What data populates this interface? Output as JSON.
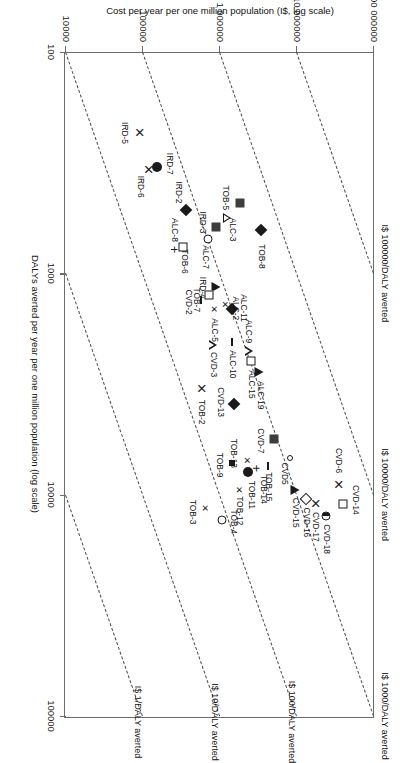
{
  "chart_data": {
    "type": "scatter",
    "title": "",
    "xlabel": "DALYs averted per year per one million population (log scale)",
    "ylabel": "Cost per year per one million population (I$, log scale)",
    "xscale": "log",
    "yscale": "log",
    "xlim": [
      100,
      100000
    ],
    "ylim": [
      10000,
      100000000
    ],
    "xticks": [
      "100",
      "1000",
      "10000",
      "100000"
    ],
    "yticks": [
      "10000",
      "100000",
      "1000000",
      "10000000",
      "100000000"
    ],
    "grid": false,
    "legend": "none",
    "reference_lines": [
      {
        "label": "I$ 1/DALY averted",
        "ratio": 1
      },
      {
        "label": "I$ 10/DALY averted",
        "ratio": 10
      },
      {
        "label": "I$ 100/DALY averted",
        "ratio": 100
      },
      {
        "label": "I$ 1000/DALY averted",
        "ratio": 1000
      },
      {
        "label": "I$ 10000/DALY averted",
        "ratio": 10000
      },
      {
        "label": "I$ 100000/DALY averted",
        "ratio": 100000
      }
    ],
    "points": [
      {
        "label": "CVD-14",
        "x": 11000,
        "y": 40000000,
        "marker": "open-square",
        "lx": -4,
        "ly": -13
      },
      {
        "label": "CVD-18",
        "x": 12500,
        "y": 24000000,
        "marker": "half-circle",
        "lx": 23,
        "ly": -1
      },
      {
        "label": "CVD-17",
        "x": 11000,
        "y": 17000000,
        "marker": "x",
        "lx": 23,
        "ly": -1
      },
      {
        "label": "CVD-16",
        "x": 10500,
        "y": 13000000,
        "marker": "open-diamond",
        "lx": 23,
        "ly": -1
      },
      {
        "label": "CVD-15",
        "x": 9500,
        "y": 9500000,
        "marker": "filled-triangle",
        "lx": 23,
        "ly": -1
      },
      {
        "label": "CVD-6",
        "x": 9000,
        "y": 34000000,
        "marker": "x",
        "lx": -24,
        "ly": -1
      },
      {
        "label": "CVD5",
        "x": 6800,
        "y": 8000000,
        "marker": "open-circle-small",
        "lx": 16,
        "ly": 5
      },
      {
        "label": "CVD-7",
        "x": 5600,
        "y": 5000000,
        "marker": "filled-square",
        "lx": 2,
        "ly": 13
      },
      {
        "label": "TOB-15",
        "x": 7400,
        "y": 4200000,
        "marker": "dash",
        "lx": 21,
        "ly": -1
      },
      {
        "label": "TOB-14",
        "x": 7600,
        "y": 2900000,
        "marker": "plus",
        "lx": 21,
        "ly": -8
      },
      {
        "label": "TOB-11",
        "x": 7900,
        "y": 2300000,
        "marker": "filled-circle",
        "lx": 23,
        "ly": -4
      },
      {
        "label": "TOB-13",
        "x": 7000,
        "y": 2250000,
        "marker": "x-small",
        "lx": -7,
        "ly": 13
      },
      {
        "label": "TOB-12",
        "x": 9500,
        "y": 1750000,
        "marker": "x-small",
        "lx": 21,
        "ly": -1
      },
      {
        "label": "TOB-9",
        "x": 7200,
        "y": 1450000,
        "marker": "filled-square-small",
        "lx": 2,
        "ly": 12
      },
      {
        "label": "TOB-4",
        "x": 13000,
        "y": 1050000,
        "marker": "open-circle",
        "lx": 2,
        "ly": -12
      },
      {
        "label": "TOB-3",
        "x": 11500,
        "y": 640000,
        "marker": "x-small",
        "lx": 4,
        "ly": 12
      },
      {
        "label": "TOB-2",
        "x": 3300,
        "y": 560000,
        "marker": "x",
        "lx": 24,
        "ly": -1
      },
      {
        "label": "ALC-19",
        "x": 2800,
        "y": 3200000,
        "marker": "filled-triangle",
        "lx": 23,
        "ly": -2
      },
      {
        "label": "ALC-15",
        "x": 2500,
        "y": 2500000,
        "marker": "open-square",
        "lx": 23,
        "ly": -1
      },
      {
        "label": "ALC-9",
        "x": 2250,
        "y": 2350000,
        "marker": "open-triangle",
        "lx": -20,
        "ly": 0
      },
      {
        "label": "CVD-13",
        "x": 3900,
        "y": 1500000,
        "marker": "filled-diamond",
        "lx": -2,
        "ly": 13
      },
      {
        "label": "ALC-10",
        "x": 2050,
        "y": 1450000,
        "marker": "dash",
        "lx": 22,
        "ly": -1
      },
      {
        "label": "CVD-3",
        "x": 2100,
        "y": 800000,
        "marker": "open-triangle",
        "lx": 20,
        "ly": -1
      },
      {
        "label": "ALC-5",
        "x": 1450,
        "y": 840000,
        "marker": "x-small",
        "lx": 21,
        "ly": -1
      },
      {
        "label": "ALC-11",
        "x": 1450,
        "y": 1450000,
        "marker": "filled-diamond",
        "lx": -1,
        "ly": -12
      },
      {
        "label": "ALC-2",
        "x": 1380,
        "y": 1150000,
        "marker": "x-small",
        "lx": 4,
        "ly": -11
      },
      {
        "label": "IRD-4",
        "x": 1150,
        "y": 900000,
        "marker": "filled-triangle",
        "lx": 1,
        "ly": 13
      },
      {
        "label": "TOB-7",
        "x": 1250,
        "y": 730000,
        "marker": "open-square",
        "lx": 5,
        "ly": 12
      },
      {
        "label": "CVD-2",
        "x": 1320,
        "y": 560000,
        "marker": "dash",
        "lx": 2,
        "ly": 12
      },
      {
        "label": "TOB-8",
        "x": 640,
        "y": 3400000,
        "marker": "filled-diamond",
        "lx": 26,
        "ly": -1
      },
      {
        "label": "TOB-5",
        "x": 480,
        "y": 1800000,
        "marker": "filled-square",
        "lx": -5,
        "ly": 14
      },
      {
        "label": "ALC-3",
        "x": 560,
        "y": 1250000,
        "marker": "open-triangle",
        "lx": 12,
        "ly": -6
      },
      {
        "label": "IRD-3",
        "x": 620,
        "y": 900000,
        "marker": "filled-square",
        "lx": -5,
        "ly": 13
      },
      {
        "label": "ALC-7",
        "x": 700,
        "y": 690000,
        "marker": "open-circle",
        "lx": 18,
        "ly": 2
      },
      {
        "label": "IRD-2",
        "x": 520,
        "y": 360000,
        "marker": "filled-diamond",
        "lx": -18,
        "ly": 7
      },
      {
        "label": "ALC-8",
        "x": 760,
        "y": 330000,
        "marker": "open-square",
        "lx": -17,
        "ly": 8
      },
      {
        "label": "TOB-6",
        "x": 780,
        "y": 250000,
        "marker": "plus",
        "lx": 12,
        "ly": -11
      },
      {
        "label": "IRD-7",
        "x": 330,
        "y": 150000,
        "marker": "filled-circle",
        "lx": -3,
        "ly": -13
      },
      {
        "label": "IRD-6",
        "x": 340,
        "y": 115000,
        "marker": "x",
        "lx": 17,
        "ly": 7
      },
      {
        "label": "IRD-5",
        "x": 230,
        "y": 90000,
        "marker": "x",
        "lx": 1,
        "ly": 14
      }
    ]
  }
}
